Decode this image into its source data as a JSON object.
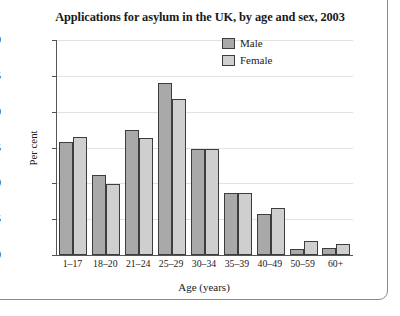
{
  "chart_data": {
    "type": "bar",
    "title": "Applications for asylum in the UK, by age and sex, 2003",
    "xlabel": "Age (years)",
    "ylabel": "Per cent",
    "ylim": [
      0,
      30
    ],
    "yticks": [
      0,
      5,
      10,
      15,
      20,
      25,
      30
    ],
    "grid": true,
    "legend_position": "top-right inside plot area",
    "categories": [
      "1–17",
      "18–20",
      "21–24",
      "25–29",
      "30–34",
      "35–39",
      "40–49",
      "50–59",
      "60+"
    ],
    "series": [
      {
        "name": "Male",
        "color": "#a9a9a9",
        "values": [
          15.8,
          11.2,
          17.4,
          24.0,
          14.8,
          8.6,
          5.7,
          0.9,
          1.0
        ]
      },
      {
        "name": "Female",
        "color": "#cfcfcf",
        "values": [
          16.5,
          9.9,
          16.3,
          21.8,
          14.8,
          8.6,
          6.5,
          1.9,
          1.6
        ]
      }
    ]
  },
  "legend": {
    "items": [
      {
        "label": "Male",
        "swatch": "male-swatch"
      },
      {
        "label": "Female",
        "swatch": "female-swatch"
      }
    ]
  }
}
